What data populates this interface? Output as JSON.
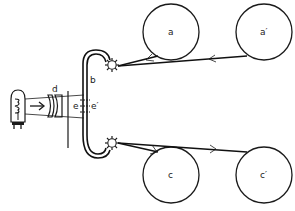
{
  "diagram": {
    "labels": {
      "reel_a": "a",
      "reel_a_prime": "a′",
      "reel_c": "c",
      "reel_c_prime": "c′",
      "film_loop": "b",
      "lens": "d",
      "gate_left": "e",
      "gate_right": "e′"
    },
    "components": [
      {
        "id": "lamp",
        "name": "light bulb"
      },
      {
        "id": "lens",
        "name": "condenser lens",
        "label": "d"
      },
      {
        "id": "aperture",
        "name": "aperture plate"
      },
      {
        "id": "gate",
        "name": "film gate",
        "labels": [
          "e",
          "e′"
        ]
      },
      {
        "id": "film",
        "name": "film loop",
        "label": "b"
      },
      {
        "id": "sprocket_top",
        "name": "upper sprocket"
      },
      {
        "id": "sprocket_bottom",
        "name": "lower sprocket"
      },
      {
        "id": "reel_a",
        "label": "a"
      },
      {
        "id": "reel_a_prime",
        "label": "a′"
      },
      {
        "id": "reel_c",
        "label": "c"
      },
      {
        "id": "reel_c_prime",
        "label": "c′"
      }
    ],
    "colors": {
      "ink": "#1a1a1a",
      "background": "#ffffff"
    }
  }
}
